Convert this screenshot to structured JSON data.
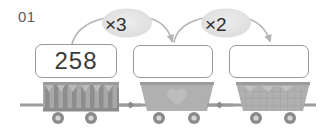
{
  "worksheet": {
    "problem_number": "01",
    "type": "multiplication-chain",
    "start_value": "258"
  },
  "boxes": [
    {
      "name": "box-1",
      "value": "258",
      "filled": true
    },
    {
      "name": "box-2",
      "value": "",
      "filled": false
    },
    {
      "name": "box-3",
      "value": "",
      "filled": false
    }
  ],
  "operations": [
    {
      "name": "op-1",
      "label": "×3",
      "operator": "×",
      "operand": "3"
    },
    {
      "name": "op-2",
      "label": "×2",
      "operator": "×",
      "operand": "2"
    }
  ],
  "carts": [
    {
      "name": "cart-1",
      "pattern": "vertical-stripes"
    },
    {
      "name": "cart-2",
      "pattern": "solid-heart"
    },
    {
      "name": "cart-3",
      "pattern": "grid-check"
    }
  ],
  "colors": {
    "box_border": "#9a9a9a",
    "box_fill": "#ffffff",
    "text_dark": "#3a3a3a",
    "label_gray": "#5a5a5a",
    "bubble_fill": "#e2e2e2",
    "arrow": "#b4b4b4",
    "rail": "#9c9c9c",
    "cart_light": "#b8b8b8",
    "cart_mid": "#a6a6a6",
    "cart_dark": "#8e8e8e",
    "wheel": "#8a8a8a",
    "wheel_center": "#d6d6d6"
  }
}
